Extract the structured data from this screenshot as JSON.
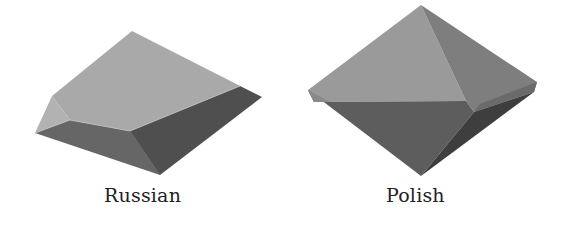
{
  "figure": {
    "items": [
      {
        "label": "Russian",
        "shape": "beveled-slab",
        "faces": {
          "top": "#a9a9a9",
          "top_left_bevel": "#b4b4b4",
          "top_right_bevel": "#9c9c9c",
          "front_left": "#6a6a6a",
          "front_right": "#4f4f4f",
          "left_end": "#777777"
        }
      },
      {
        "label": "Polish",
        "shape": "octahedral-point",
        "faces": {
          "upper_left": "#9a9a9a",
          "upper_right": "#7f7f7f",
          "lower_left": "#5e5e5e",
          "lower_right": "#454545",
          "right_notch": "#333333",
          "left_rim": "#8e8e8e"
        }
      }
    ]
  }
}
